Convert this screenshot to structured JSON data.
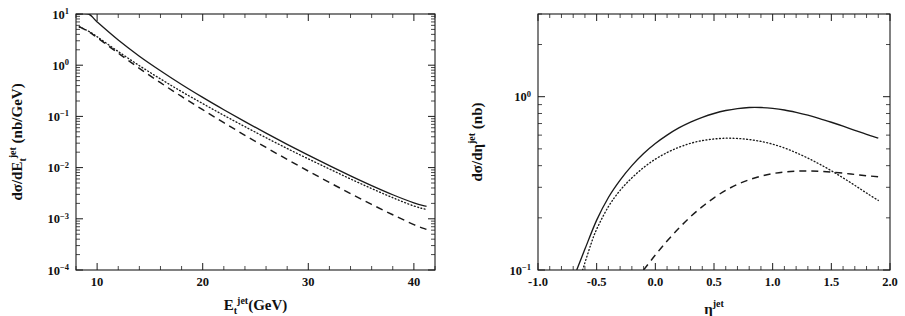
{
  "figure": {
    "name": "two-panel-jet-cross-section-figure",
    "background": "#ffffff",
    "ink_color": "#1a1a1a"
  },
  "chart_data": [
    {
      "id": "left",
      "type": "line",
      "title": "",
      "xlabel": "E_t^jet (GeV)",
      "xlabel_parts": {
        "base": "E",
        "sub": "t",
        "sup": "jet",
        "unit": "(GeV)"
      },
      "ylabel": "dσ/dE_t^jet (nb/GeV)",
      "ylabel_parts": {
        "prefix": "dσ/dE",
        "sub": "t",
        "sup": "jet",
        "unit": "(nb/GeV)"
      },
      "xscale": "linear",
      "yscale": "log",
      "xlim": [
        8,
        42
      ],
      "ylim": [
        0.0001,
        10
      ],
      "grid": false,
      "legend": "none",
      "xticks_major": [
        10,
        20,
        30,
        40
      ],
      "xticks_major_labels": [
        "10",
        "20",
        "30",
        "40"
      ],
      "xtick_minor_step": 2,
      "yticks_major": [
        0.0001,
        0.001,
        0.01,
        0.1,
        1,
        10
      ],
      "yticks_major_labels": [
        "10−4",
        "10−3",
        "10−2",
        "10−1",
        "10⁰",
        "10¹"
      ],
      "ytick_label_mantissa": "10",
      "ytick_label_exponents": [
        "-4",
        "-3",
        "-2",
        "-1",
        "0",
        "1"
      ],
      "series": [
        {
          "name": "solid",
          "style": "solid",
          "x": [
            8.0,
            9.2,
            10,
            12,
            14,
            16,
            18,
            20,
            22,
            24,
            26,
            28,
            30,
            32,
            34,
            36,
            38,
            40,
            41.2
          ],
          "y": [
            10.0,
            10.0,
            7.0,
            3.1,
            1.5,
            0.78,
            0.42,
            0.235,
            0.135,
            0.079,
            0.047,
            0.0285,
            0.0175,
            0.0109,
            0.0069,
            0.00445,
            0.00295,
            0.00205,
            0.00175
          ]
        },
        {
          "name": "dotted",
          "style": "dotted",
          "x": [
            8.3,
            9.2,
            10,
            12,
            14,
            16,
            18,
            20,
            22,
            24,
            26,
            28,
            30,
            32,
            34,
            36,
            38,
            40,
            41.2
          ],
          "y": [
            5.6,
            4.6,
            3.6,
            1.85,
            0.98,
            0.54,
            0.305,
            0.178,
            0.105,
            0.063,
            0.0383,
            0.0236,
            0.0148,
            0.0094,
            0.006,
            0.0039,
            0.00258,
            0.00178,
            0.00152
          ]
        },
        {
          "name": "dashed",
          "style": "dashed",
          "x": [
            8.3,
            9.2,
            10,
            12,
            14,
            16,
            18,
            20,
            22,
            24,
            26,
            28,
            30,
            32,
            34,
            36,
            38,
            40,
            41.2
          ],
          "y": [
            5.7,
            4.5,
            3.45,
            1.72,
            0.87,
            0.455,
            0.245,
            0.135,
            0.0755,
            0.0428,
            0.0247,
            0.01445,
            0.00855,
            0.00512,
            0.00311,
            0.00191,
            0.0012,
            0.00077,
            0.00062
          ]
        }
      ]
    },
    {
      "id": "right",
      "type": "line",
      "title": "",
      "xlabel": "η^jet",
      "xlabel_parts": {
        "base": "η",
        "sup": "jet"
      },
      "ylabel": "dσ/dη^jet (nb)",
      "ylabel_parts": {
        "prefix": "dσ/dη",
        "sup": "jet",
        "unit": "(nb)"
      },
      "xscale": "linear",
      "yscale": "log",
      "xlim": [
        -1.0,
        2.0
      ],
      "ylim": [
        0.1,
        3.0
      ],
      "grid": false,
      "legend": "none",
      "xticks_major": [
        -1.0,
        -0.5,
        0.0,
        0.5,
        1.0,
        1.5,
        2.0
      ],
      "xticks_major_labels": [
        "-1.0",
        "-0.5",
        "0.0",
        "0.5",
        "1.0",
        "1.5",
        "2.0"
      ],
      "xtick_minor_step": 0.1,
      "yticks_major": [
        0.1,
        1.0
      ],
      "yticks_major_labels": [
        "10−1",
        "10⁰"
      ],
      "ytick_label_mantissa": "10",
      "ytick_label_exponents": [
        "-1",
        "0"
      ],
      "series": [
        {
          "name": "solid",
          "style": "solid",
          "x": [
            -0.67,
            -0.6,
            -0.5,
            -0.4,
            -0.3,
            -0.2,
            -0.1,
            0.0,
            0.1,
            0.2,
            0.3,
            0.4,
            0.5,
            0.6,
            0.7,
            0.8,
            0.9,
            1.0,
            1.1,
            1.2,
            1.3,
            1.4,
            1.5,
            1.6,
            1.7,
            1.8,
            1.9
          ],
          "y": [
            0.1,
            0.132,
            0.194,
            0.262,
            0.33,
            0.4,
            0.47,
            0.537,
            0.6,
            0.66,
            0.713,
            0.76,
            0.8,
            0.832,
            0.854,
            0.866,
            0.866,
            0.856,
            0.838,
            0.812,
            0.782,
            0.748,
            0.712,
            0.676,
            0.64,
            0.606,
            0.576
          ]
        },
        {
          "name": "dotted",
          "style": "dotted",
          "x": [
            -0.62,
            -0.55,
            -0.5,
            -0.4,
            -0.3,
            -0.2,
            -0.1,
            0.0,
            0.1,
            0.2,
            0.3,
            0.4,
            0.5,
            0.6,
            0.7,
            0.8,
            0.9,
            1.0,
            1.1,
            1.2,
            1.3,
            1.4,
            1.5,
            1.6,
            1.7,
            1.8,
            1.9
          ],
          "y": [
            0.1,
            0.14,
            0.172,
            0.232,
            0.288,
            0.34,
            0.39,
            0.436,
            0.476,
            0.51,
            0.538,
            0.558,
            0.57,
            0.576,
            0.574,
            0.566,
            0.552,
            0.532,
            0.506,
            0.475,
            0.442,
            0.408,
            0.374,
            0.34,
            0.308,
            0.278,
            0.252
          ]
        },
        {
          "name": "dashed",
          "style": "dashed",
          "x": [
            -0.1,
            0.0,
            0.1,
            0.2,
            0.3,
            0.4,
            0.5,
            0.6,
            0.7,
            0.8,
            0.9,
            1.0,
            1.1,
            1.2,
            1.3,
            1.4,
            1.5,
            1.6,
            1.7,
            1.8,
            1.9
          ],
          "y": [
            0.1,
            0.122,
            0.147,
            0.174,
            0.203,
            0.232,
            0.261,
            0.288,
            0.312,
            0.332,
            0.348,
            0.36,
            0.368,
            0.372,
            0.373,
            0.371,
            0.367,
            0.362,
            0.356,
            0.35,
            0.345
          ]
        }
      ]
    }
  ]
}
